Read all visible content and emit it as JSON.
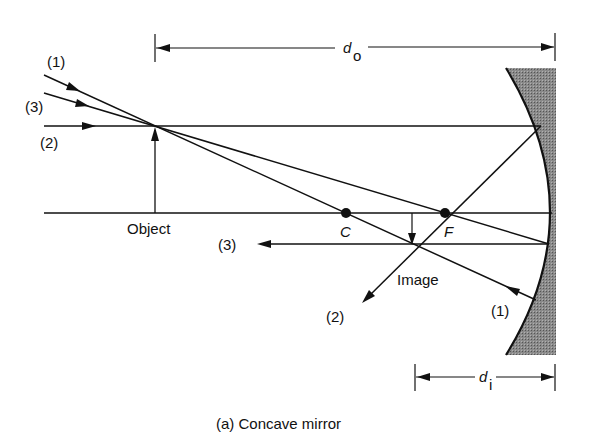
{
  "diagram": {
    "caption": "(a) Concave mirror",
    "labels": {
      "object": "Object",
      "image": "Image",
      "center": "C",
      "focus": "F",
      "d_o_main": "d",
      "d_o_sub": "o",
      "d_i_main": "d",
      "d_i_sub": "i"
    },
    "rays": {
      "ray1_in": "(1)",
      "ray3_in": "(3)",
      "ray2_in": "(2)",
      "ray3_out": "(3)",
      "ray2_out": "(2)",
      "ray1_out": "(1)"
    }
  },
  "colors": {
    "line": "#111111",
    "mirror_fill": "#7a7a7a",
    "background": "#ffffff"
  }
}
